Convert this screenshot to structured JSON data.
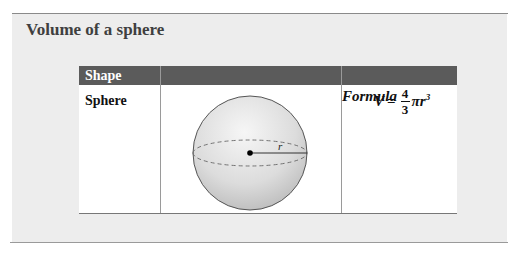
{
  "title": "Volume of a sphere",
  "table": {
    "headers": [
      "Shape",
      "Diagram",
      "Formula"
    ],
    "rows": [
      {
        "shape": "Sphere",
        "diagram": {
          "type": "sphere",
          "label": "r"
        },
        "formula": {
          "lhs": "V",
          "equals": "=",
          "numerator": "4",
          "denominator": "3",
          "pi": "π",
          "var": "r",
          "exponent": "3"
        }
      }
    ]
  },
  "colors": {
    "header_bg": "#5b5b5b",
    "panel_bg": "#ededed",
    "title": "#3f3f3f"
  }
}
